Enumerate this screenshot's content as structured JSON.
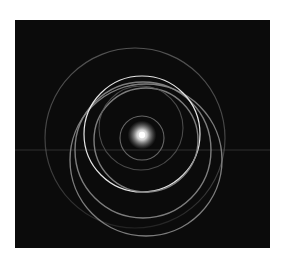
{
  "image": {
    "subject": "orbital rings around a central star on dark background",
    "background_color": "#0b0b0b",
    "frame_color": "#ffffff",
    "panel": {
      "x": 15,
      "y": 20,
      "width": 255,
      "height": 228
    },
    "star": {
      "cx": 142,
      "cy": 135,
      "r": 9,
      "color": "#ffffff"
    },
    "horizon_line": {
      "y": 150,
      "color": "#3a3a3a"
    },
    "rings": [
      {
        "name": "outer-ring",
        "cx": 135,
        "cy": 138,
        "r": 90,
        "stroke": "#6a6a6a",
        "width": 1.2,
        "opacity": 0.85
      },
      {
        "name": "ring-a",
        "cx": 146,
        "cy": 160,
        "r": 76,
        "stroke": "#8a8a8a",
        "width": 1.4,
        "opacity": 0.9
      },
      {
        "name": "ring-b",
        "cx": 143,
        "cy": 150,
        "r": 68,
        "stroke": "#8a8a8a",
        "width": 1.4,
        "opacity": 0.9
      },
      {
        "name": "bright-ring",
        "cx": 142,
        "cy": 134,
        "r": 58,
        "stroke": "#e6e6e6",
        "width": 1.2,
        "opacity": 1
      },
      {
        "name": "ring-c",
        "cx": 146,
        "cy": 140,
        "r": 52,
        "stroke": "#8a8a8a",
        "width": 1.4,
        "opacity": 0.9
      },
      {
        "name": "ring-d",
        "cx": 141,
        "cy": 128,
        "r": 42,
        "stroke": "#5a5a5a",
        "width": 1.1,
        "opacity": 0.8
      },
      {
        "name": "inner-ring",
        "cx": 142,
        "cy": 138,
        "r": 22,
        "stroke": "#707070",
        "width": 1.1,
        "opacity": 0.9
      }
    ]
  }
}
